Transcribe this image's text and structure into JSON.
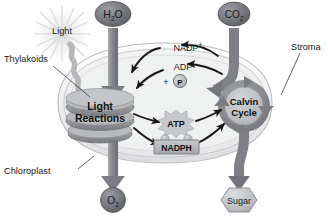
{
  "diagram": {
    "outer_labels": [
      {
        "id": "thylakoids",
        "text": "Thylakoids",
        "x": 4,
        "y": 60
      },
      {
        "id": "chloroplast",
        "text": "Chloroplast",
        "x": 4,
        "y": 172
      },
      {
        "id": "stroma",
        "text": "Stroma",
        "x": 291,
        "y": 48
      },
      {
        "id": "light",
        "text": "Light",
        "x": 42,
        "y": 31
      }
    ],
    "inputs": [
      {
        "id": "h2o",
        "base": "H",
        "sub": "2",
        "tail": "O",
        "shape": "ellipse",
        "x": 113,
        "y": 14
      },
      {
        "id": "co2",
        "base": "CO",
        "sub": "2",
        "tail": "",
        "shape": "ellipse",
        "x": 234,
        "y": 14
      }
    ],
    "outputs": [
      {
        "id": "o2",
        "base": "O",
        "sub": "2",
        "tail": "",
        "shape": "ellipse",
        "x": 113,
        "y": 200
      },
      {
        "id": "sugar",
        "base": "Sugar",
        "sub": "",
        "tail": "",
        "shape": "hexagon",
        "x": 239,
        "y": 200
      }
    ],
    "processes": [
      {
        "id": "light-reactions",
        "line1": "Light",
        "line2": "Reactions",
        "shape": "thylakoid-stack",
        "x": 100,
        "y": 108
      },
      {
        "id": "calvin-cycle",
        "line1": "Calvin",
        "line2": "Cycle",
        "shape": "cycle-ring",
        "x": 244,
        "y": 106
      }
    ],
    "carriers": [
      {
        "id": "nadp-plus",
        "base": "NADP",
        "sup": "+",
        "x": 188,
        "y": 48,
        "shape": "plain"
      },
      {
        "id": "adp",
        "base": "ADP",
        "sup": "",
        "x": 183,
        "y": 67,
        "shape": "plain"
      },
      {
        "id": "phosphate",
        "base": "P",
        "sup": "",
        "prefix": "+",
        "x": 178,
        "y": 81,
        "shape": "circle"
      },
      {
        "id": "atp",
        "base": "ATP",
        "sup": "",
        "x": 176,
        "y": 122,
        "shape": "burst"
      },
      {
        "id": "nadph",
        "base": "NADPH",
        "sup": "",
        "x": 176,
        "y": 145,
        "shape": "box"
      }
    ],
    "colors": {
      "arrow_gray": "#8f9196",
      "arrow_dark": "#6f7176",
      "molecule_fill": "#6e7076",
      "membrane": "#c9cacb",
      "stroma_fill": "#eceded",
      "process_fill": "#9b9da2",
      "process_fill_light": "#bdbfc3",
      "text_dark": "#1a1a1a",
      "ring_gray": "#86888d",
      "burst_gray": "#b9bbbf",
      "box_fill": "#b4b6ba",
      "leader_line": "#3a3a44",
      "background": "#ffffff"
    }
  }
}
